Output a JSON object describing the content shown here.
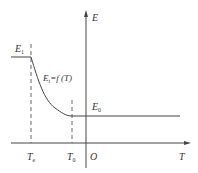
{
  "diagram": {
    "type": "energy-temperature curve",
    "colors": {
      "line": "#444444",
      "text": "#333333",
      "background": "#ffffff"
    },
    "axes": {
      "vertical": {
        "label": "E"
      },
      "horizontal": {
        "label": "T"
      },
      "origin": {
        "label": "O"
      }
    },
    "levels": {
      "e1": {
        "label_main": "E",
        "label_sub": "1"
      },
      "e0": {
        "label_main": "E",
        "label_sub": "0"
      }
    },
    "curve": {
      "label_main": "E",
      "label_sub": "t",
      "label_rest": "=f (T)"
    },
    "ticks": {
      "te": {
        "label_main": "T",
        "label_sub": "e"
      },
      "t0": {
        "label_main": "T",
        "label_sub": "0"
      }
    }
  }
}
